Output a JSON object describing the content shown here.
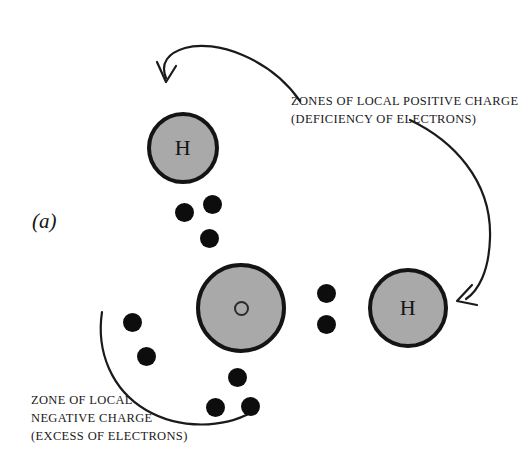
{
  "figure": {
    "panel_label": "(a)",
    "background_color": "#ffffff",
    "atom_fill_color": "#a9a9a9",
    "atom_border_color": "#141414",
    "electron_color": "#0d0d0d",
    "ink_color": "#1a1a1a"
  },
  "atoms": [
    {
      "symbol": "H",
      "name": "hydrogen-top",
      "x": 147,
      "y": 112,
      "d": 72
    },
    {
      "symbol": "O",
      "name": "oxygen-center",
      "x": 196,
      "y": 263,
      "d": 90
    },
    {
      "symbol": "H",
      "name": "hydrogen-right",
      "x": 368,
      "y": 268,
      "d": 80
    }
  ],
  "electrons": [
    {
      "x": 175,
      "y": 203
    },
    {
      "x": 203,
      "y": 195
    },
    {
      "x": 200,
      "y": 229
    },
    {
      "x": 317,
      "y": 284
    },
    {
      "x": 317,
      "y": 315
    },
    {
      "x": 123,
      "y": 313
    },
    {
      "x": 137,
      "y": 347
    },
    {
      "x": 228,
      "y": 368
    },
    {
      "x": 206,
      "y": 398
    },
    {
      "x": 241,
      "y": 397
    }
  ],
  "annotations": {
    "positive": {
      "lines": [
        "ZONES OF LOCAL POSITIVE CHARGE",
        "(DEFICIENCY OF ELECTRONS)"
      ]
    },
    "negative": {
      "lines": [
        "ZONE  OF LOCAL",
        "NEGATIVE CHARGE",
        "(EXCESS OF ELECTRONS)"
      ]
    }
  },
  "pointers": {
    "arrow_to_top_hydrogen": "curved-arrow",
    "arrow_to_right_hydrogen": "curved-arrow",
    "negative_zone_boundary": "curved-arc"
  }
}
